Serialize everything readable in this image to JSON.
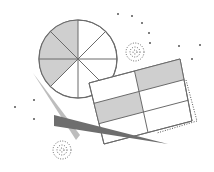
{
  "illustration": {
    "description": "Abstract data illustration: pie chart, tilted table grid, wedges and dotted accents",
    "colors": {
      "background": "#ffffff",
      "stroke": "#6b6b6b",
      "fill_light": "#cfcfcf",
      "fill_dark": "#6e6e6e",
      "fill_mid": "#bdbdbd",
      "dot": "#555555"
    },
    "pie": {
      "cx": 78,
      "cy": 59,
      "r": 39,
      "slices": 8,
      "shaded_slices": [
        5,
        6,
        7
      ]
    },
    "table": {
      "corners": [
        [
          89,
          83
        ],
        [
          180,
          59
        ],
        [
          192,
          121
        ],
        [
          104,
          144
        ]
      ],
      "rows": 3,
      "cols": 2,
      "shaded_cells": [
        [
          0,
          1
        ],
        [
          1,
          0
        ]
      ]
    },
    "dotted_shadow": {
      "points": [
        [
          186,
          80
        ],
        [
          197,
          121
        ],
        [
          157,
          133
        ]
      ]
    },
    "wedges": [
      {
        "name": "light-wedge",
        "points": [
          [
            33,
            73
          ],
          [
            80,
            135
          ],
          [
            76,
            140
          ]
        ],
        "color": "#bdbdbd"
      },
      {
        "name": "dark-wedge",
        "points": [
          [
            54,
            115
          ],
          [
            54,
            126
          ],
          [
            168,
            144
          ]
        ],
        "color": "#6e6e6e"
      }
    ],
    "dotted_circles": [
      {
        "cx": 135,
        "cy": 52,
        "radii": [
          9,
          5,
          2
        ]
      },
      {
        "cx": 62,
        "cy": 150,
        "radii": [
          9,
          5,
          2
        ]
      }
    ],
    "specks": [
      [
        118,
        14
      ],
      [
        132,
        16
      ],
      [
        142,
        23
      ],
      [
        149,
        33
      ],
      [
        150,
        43
      ],
      [
        179,
        46
      ],
      [
        200,
        45
      ],
      [
        192,
        59
      ],
      [
        15,
        107
      ],
      [
        34,
        100
      ],
      [
        34,
        119
      ]
    ]
  }
}
